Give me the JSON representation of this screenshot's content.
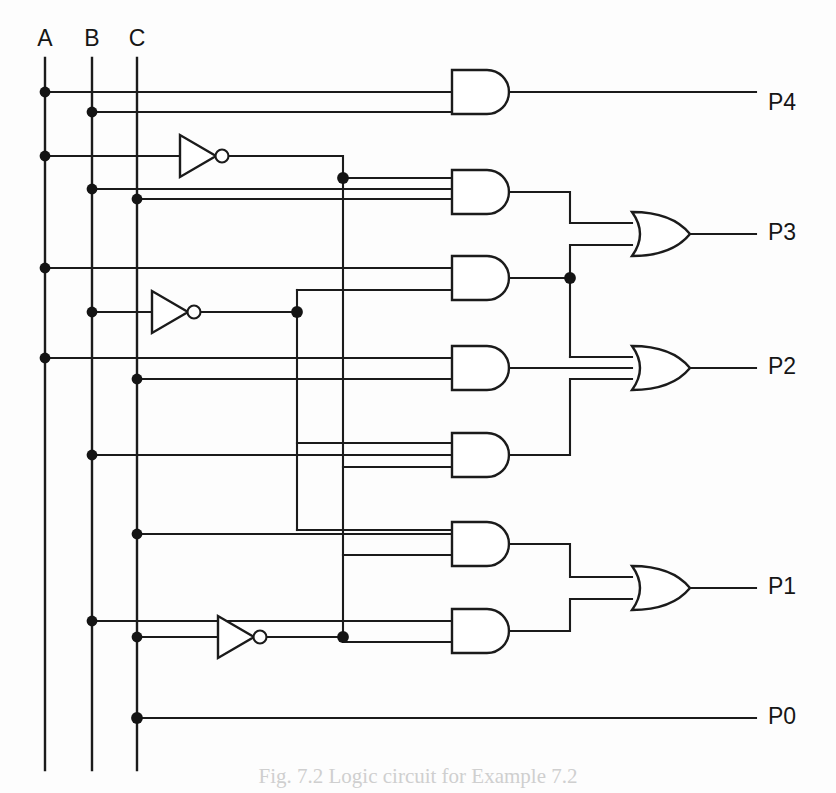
{
  "figure": {
    "kind": "logic-circuit-diagram",
    "caption": "Fig. 7.2 Logic circuit for Example 7.2",
    "background_color": "#fdfdfd",
    "line_color": "#1b1b1b"
  },
  "inputs": [
    {
      "id": "A",
      "label": "A",
      "bus_x": 45,
      "label_x": 45,
      "label_y": 40
    },
    {
      "id": "B",
      "label": "B",
      "bus_x": 92,
      "label_x": 92,
      "label_y": 40
    },
    {
      "id": "C",
      "label": "C",
      "bus_x": 137,
      "label_x": 137,
      "label_y": 40
    }
  ],
  "outputs": [
    {
      "id": "P4",
      "label": "P4",
      "x": 768,
      "y": 104
    },
    {
      "id": "P3",
      "label": "P3",
      "x": 768,
      "y": 234
    },
    {
      "id": "P2",
      "label": "P2",
      "x": 768,
      "y": 368
    },
    {
      "id": "P1",
      "label": "P1",
      "x": 768,
      "y": 588
    },
    {
      "id": "P0",
      "label": "P0",
      "x": 768,
      "y": 718
    }
  ],
  "inverters": [
    {
      "id": "inv-A",
      "source": "A",
      "output_name": "not-A",
      "x": 180,
      "y": 156
    },
    {
      "id": "inv-B",
      "source": "B",
      "output_name": "not-B",
      "x": 152,
      "y": 312
    },
    {
      "id": "inv-C",
      "source": "C",
      "output_name": "not-C",
      "x": 218,
      "y": 637
    }
  ],
  "and_gates": [
    {
      "id": "AND1",
      "inputs": 2,
      "feeds": "P4",
      "x": 452,
      "y": 92
    },
    {
      "id": "AND2",
      "inputs": 3,
      "feeds": "OR-P3",
      "x": 452,
      "y": 192
    },
    {
      "id": "AND3",
      "inputs": 2,
      "feeds": "OR-P3 and OR-P2",
      "x": 452,
      "y": 278
    },
    {
      "id": "AND4",
      "inputs": 2,
      "feeds": "OR-P2",
      "x": 452,
      "y": 368
    },
    {
      "id": "AND5",
      "inputs": 3,
      "feeds": "OR-P2",
      "x": 452,
      "y": 455
    },
    {
      "id": "AND6",
      "inputs": 2,
      "feeds": "OR-P1",
      "x": 452,
      "y": 544
    },
    {
      "id": "AND7",
      "inputs": 2,
      "feeds": "OR-P1",
      "x": 452,
      "y": 631
    }
  ],
  "or_gates": [
    {
      "id": "OR-P3",
      "inputs": 2,
      "feeds": "P3",
      "x": 632,
      "y": 234
    },
    {
      "id": "OR-P2",
      "inputs": 3,
      "feeds": "P2",
      "x": 632,
      "y": 368
    },
    {
      "id": "OR-P1",
      "inputs": 2,
      "feeds": "P1",
      "x": 632,
      "y": 588
    }
  ],
  "direct_connections": [
    {
      "from": "C",
      "to": "P0",
      "y": 718
    }
  ]
}
